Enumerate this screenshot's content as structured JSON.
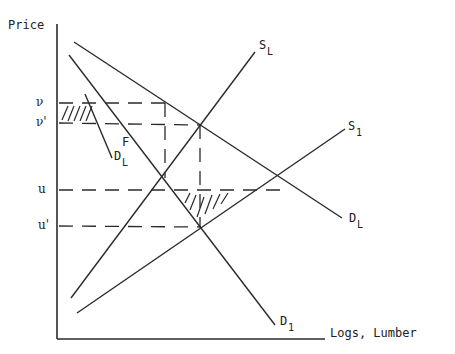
{
  "diagram": {
    "y_axis_label": "Price",
    "x_axis_label": "Logs, Lumber",
    "price_levels": [
      {
        "label": "ν",
        "y": 103
      },
      {
        "label": "ν'",
        "y": 123
      },
      {
        "label": "u",
        "y": 190
      },
      {
        "label": "u'",
        "y": 226
      }
    ],
    "curves": {
      "D_L_main": {
        "label": "D",
        "sub": "L"
      },
      "D_1": {
        "label": "D",
        "sub": "1"
      },
      "S_L": {
        "label": "S",
        "sub": "L"
      },
      "S_1": {
        "label": "S",
        "sub": "1"
      },
      "D_L_small": {
        "label": "D",
        "sub": "L"
      }
    },
    "point_F": "F"
  }
}
